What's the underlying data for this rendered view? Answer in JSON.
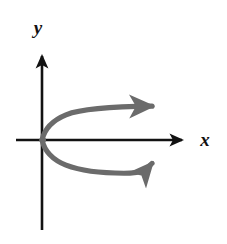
{
  "figure": {
    "background_color": "#ffffff",
    "width": 227,
    "height": 244
  },
  "axes": {
    "color": "#121212",
    "stroke_width": 2.6,
    "x_axis": {
      "name": "x-axis",
      "label": "x",
      "label_x": 205,
      "label_y": 146,
      "y": 140,
      "x_start": 16,
      "x_end": 182,
      "arrow": "right"
    },
    "y_axis": {
      "name": "y-axis",
      "label": "y",
      "label_x": 38,
      "label_y": 34,
      "x": 42,
      "y_start": 230,
      "y_end": 56,
      "arrow": "up"
    },
    "origin": {
      "x": 42,
      "y": 140
    }
  },
  "chart_data": {
    "type": "line",
    "xlabel": "x",
    "ylabel": "y",
    "grid": false,
    "legend": null,
    "curve_color": "#6b6b6b",
    "curve_width": 5.2,
    "vertex": {
      "x": 0,
      "y": 0
    },
    "equation": "x = a*y^2",
    "opens": "right",
    "series": [
      {
        "name": "upper-branch",
        "arrow": "right",
        "points_px": [
          [
            42,
            140
          ],
          [
            44,
            133
          ],
          [
            48,
            127
          ],
          [
            54,
            122
          ],
          [
            63,
            117
          ],
          [
            75,
            113
          ],
          [
            90,
            110
          ],
          [
            108,
            108
          ],
          [
            128,
            107
          ],
          [
            150,
            107
          ]
        ],
        "arrow_tip_px": [
          166,
          106
        ]
      },
      {
        "name": "lower-branch",
        "arrow": "right",
        "points_px": [
          [
            42,
            140
          ],
          [
            44,
            147
          ],
          [
            48,
            153
          ],
          [
            54,
            158
          ],
          [
            63,
            163
          ],
          [
            75,
            167
          ],
          [
            90,
            170
          ],
          [
            108,
            172
          ],
          [
            128,
            173
          ],
          [
            150,
            163
          ]
        ],
        "arrow_tip_px": [
          166,
          162
        ]
      }
    ]
  }
}
